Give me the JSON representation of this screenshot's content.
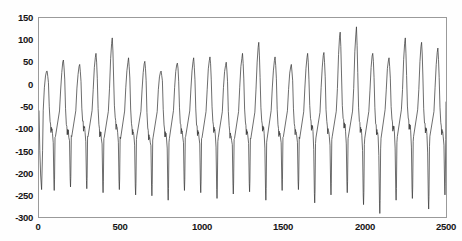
{
  "figure": {
    "top_clipped_text": "",
    "line_color": "#3a3a3a",
    "axis_color": "#9a9a9a",
    "background_color": "#ffffff"
  },
  "chart_data": {
    "type": "line",
    "title": "",
    "subtitle": "",
    "xlabel": "",
    "ylabel": "",
    "xlim": [
      0,
      2500
    ],
    "ylim": [
      -300,
      150
    ],
    "xticks": [
      0,
      500,
      1000,
      1500,
      2000,
      2500
    ],
    "yticks": [
      150,
      100,
      50,
      0,
      -50,
      -100,
      -150,
      -200,
      -250,
      -300
    ],
    "grid": false,
    "legend": null,
    "series": [
      {
        "name": "signal",
        "color": "#3a3a3a",
        "linewidth": 0.8,
        "n_points": 2500,
        "description": "quasi-periodic chaotic oscillation, ~21 cycles; each cycle: sharp rise to a peak near +20..+130, descent to a notched shoulder near -60..-110, then a deep narrow spike down to -180..-295, then recovery",
        "cycle_peaks": [
          30,
          55,
          45,
          70,
          105,
          60,
          52,
          30,
          48,
          60,
          62,
          50,
          70,
          95,
          62,
          45,
          70,
          72,
          118,
          130,
          70,
          60,
          105,
          95,
          82
        ],
        "cycle_troughs": [
          -240,
          -232,
          -236,
          -245,
          -238,
          -250,
          -252,
          -262,
          -240,
          -245,
          -258,
          -248,
          -243,
          -262,
          -240,
          -238,
          -268,
          -250,
          -245,
          -272,
          -292,
          -262,
          -258,
          -282,
          -250
        ],
        "shoulder_levels": [
          -95,
          -100,
          -92,
          -105,
          -88,
          -100,
          -112,
          -105,
          -98,
          -102,
          -95,
          -108,
          -100,
          -92,
          -104,
          -100,
          -90,
          -98,
          -85,
          -95,
          -100,
          -92,
          -88,
          -96,
          -100
        ]
      }
    ]
  },
  "axes": {
    "y_labels": [
      "150",
      "100",
      "50",
      "0",
      "-50",
      "-100",
      "-150",
      "-200",
      "-250",
      "-300"
    ],
    "x_labels": [
      "0",
      "500",
      "1000",
      "1500",
      "2000",
      "2500"
    ]
  }
}
